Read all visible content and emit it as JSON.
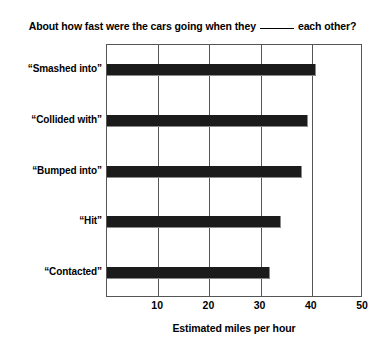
{
  "chart_data": {
    "type": "bar",
    "orientation": "horizontal",
    "title_prefix": "About how fast were the cars going when they",
    "title_suffix": "each other?",
    "title_blank": "______",
    "xlabel": "Estimated miles per hour",
    "ylabel": "",
    "categories": [
      "“Smashed into”",
      "“Collided with”",
      "“Bumped into”",
      "“Hit”",
      "“Contacted”"
    ],
    "values": [
      40.8,
      39.3,
      38.1,
      34.0,
      31.8
    ],
    "xlim": [
      0,
      50
    ],
    "xticks": [
      10,
      20,
      30,
      40,
      50
    ],
    "xtick_labels": [
      "10",
      "20",
      "30",
      "40",
      "50"
    ],
    "grid": true,
    "grid_axis": "x",
    "legend": false,
    "bar_color": "#1b1b1b",
    "frame_color": "#555555",
    "background_color": "#ffffff"
  }
}
